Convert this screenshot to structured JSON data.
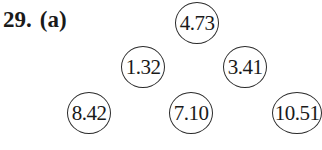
{
  "problem": {
    "number": "29.",
    "part": "(a)"
  },
  "tree": {
    "levels": [
      {
        "nodes": [
          {
            "value": "4.73",
            "cx": 197,
            "cy": 23
          }
        ]
      },
      {
        "nodes": [
          {
            "value": "1.32",
            "cx": 143,
            "cy": 67
          },
          {
            "value": "3.41",
            "cx": 245,
            "cy": 67
          }
        ]
      },
      {
        "nodes": [
          {
            "value": "8.42",
            "cx": 89,
            "cy": 113
          },
          {
            "value": "7.10",
            "cx": 191,
            "cy": 113
          },
          {
            "value": "10.51",
            "cx": 297,
            "cy": 113
          }
        ]
      }
    ]
  }
}
